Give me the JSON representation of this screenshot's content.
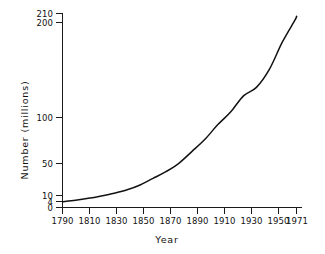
{
  "chart_data": {
    "type": "line",
    "title": "",
    "xlabel": "Year",
    "ylabel": "Number (millions)",
    "x": [
      1790,
      1800,
      1810,
      1820,
      1830,
      1840,
      1850,
      1860,
      1870,
      1880,
      1890,
      1900,
      1910,
      1920,
      1930,
      1940,
      1950,
      1960,
      1970,
      1971
    ],
    "values": [
      3.9,
      5.3,
      7.2,
      9.6,
      12.9,
      17.1,
      23.2,
      31.4,
      39.8,
      50.2,
      62.9,
      76.0,
      92.0,
      105.7,
      122.8,
      131.7,
      150.7,
      179.3,
      203.2,
      207.0
    ],
    "series": [
      {
        "name": "Population",
        "values": [
          3.9,
          5.3,
          7.2,
          9.6,
          12.9,
          17.1,
          23.2,
          31.4,
          39.8,
          50.2,
          62.9,
          76.0,
          92.0,
          105.7,
          122.8,
          131.7,
          150.7,
          179.3,
          203.2,
          207.0
        ]
      }
    ],
    "x_ticks": [
      "1790",
      "1810",
      "1830",
      "1850",
      "1870",
      "1890",
      "1910",
      "1930",
      "1950",
      "1971"
    ],
    "x_tick_values": [
      1790,
      1810,
      1830,
      1850,
      1870,
      1890,
      1910,
      1930,
      1950,
      1971
    ],
    "y_ticks": [
      "0",
      "4",
      "10",
      "50",
      "100",
      "200",
      "210"
    ],
    "y_tick_values": [
      0,
      4,
      10,
      50,
      100,
      200,
      210
    ],
    "xlim": [
      1790,
      1971
    ],
    "ylim": [
      0,
      210
    ],
    "grid": false,
    "legend": "none",
    "line_color": "#121212",
    "axis_color": "#1a1a1a",
    "background_color": "#ffffff",
    "y_scale": "nonlinear-compressed"
  }
}
